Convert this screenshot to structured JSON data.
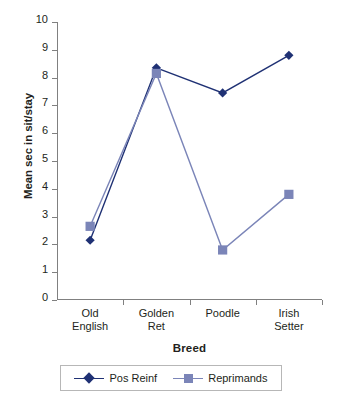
{
  "chart_data": {
    "type": "line",
    "title": "",
    "xlabel": "Breed",
    "ylabel": "Mean sec in sit/stay",
    "categories": [
      "Old\nEnglish",
      "Golden\nRet",
      "Poodle",
      "Irish\nSetter"
    ],
    "category_names": [
      "Old English",
      "Golden Ret",
      "Poodle",
      "Irish Setter"
    ],
    "ylim": [
      0,
      10
    ],
    "yticks": [
      0,
      1,
      2,
      3,
      4,
      5,
      6,
      7,
      8,
      9,
      10
    ],
    "ytick_labels": [
      "0",
      "1",
      "2",
      "3",
      "4",
      "5",
      "6",
      "7",
      "8",
      "9",
      "10"
    ],
    "grid": false,
    "legend_position": "bottom",
    "series": [
      {
        "name": "Pos Reinf",
        "marker": "diamond",
        "color": "#1f3174",
        "values": [
          2.15,
          8.35,
          7.45,
          8.8
        ]
      },
      {
        "name": "Reprimands",
        "marker": "square",
        "color": "#7b85b8",
        "values": [
          2.65,
          8.15,
          1.8,
          3.8
        ]
      }
    ]
  },
  "colors": {
    "pos_reinf": "#1f3174",
    "reprimands": "#7b85b8",
    "axis": "#808080",
    "text": "#231f20",
    "legend_border": "#b7b7b7",
    "background": "#ffffff"
  },
  "legend": {
    "items": [
      {
        "label": "Pos Reinf",
        "marker": "diamond-marker-icon"
      },
      {
        "label": "Reprimands",
        "marker": "square-marker-icon"
      }
    ]
  }
}
